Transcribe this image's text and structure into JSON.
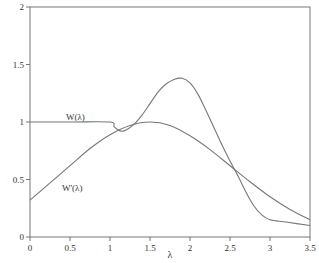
{
  "chart_data": {
    "type": "line",
    "title": "",
    "xlabel": "λ",
    "ylabel": "",
    "xlim": [
      0,
      3.5
    ],
    "ylim": [
      0,
      2
    ],
    "grid": false,
    "legend_position": "inline labels",
    "x_ticks": [
      "0",
      "0.5",
      "1",
      "1.5",
      "2",
      "2.5",
      "3",
      "3.5"
    ],
    "y_ticks": [
      "0",
      "0.5",
      "1",
      "1.5",
      "2"
    ],
    "series": [
      {
        "name": "W(λ)",
        "label_position": {
          "x": 0.45,
          "y": 1.02
        },
        "x": [
          0,
          0.5,
          1.0,
          1.05,
          1.1,
          1.15,
          1.2,
          1.3,
          1.4,
          1.5,
          1.6,
          1.7,
          1.8,
          1.9,
          2.0,
          2.1,
          2.2,
          2.3,
          2.4,
          2.5,
          2.6,
          2.7,
          2.8,
          2.9,
          3.0,
          3.2,
          3.5
        ],
        "values": [
          1.0,
          1.0,
          1.0,
          0.96,
          0.93,
          0.92,
          0.93,
          0.98,
          1.06,
          1.16,
          1.26,
          1.33,
          1.37,
          1.38,
          1.34,
          1.24,
          1.1,
          0.95,
          0.8,
          0.66,
          0.53,
          0.39,
          0.27,
          0.19,
          0.15,
          0.13,
          0.1
        ]
      },
      {
        "name": "W'(λ)",
        "label_position": {
          "x": 0.4,
          "y": 0.4
        },
        "x": [
          0,
          0.25,
          0.5,
          0.75,
          1.0,
          1.25,
          1.5,
          1.75,
          2.0,
          2.25,
          2.5,
          2.75,
          3.0,
          3.25,
          3.5
        ],
        "values": [
          0.32,
          0.47,
          0.62,
          0.77,
          0.89,
          0.97,
          1.0,
          0.97,
          0.88,
          0.76,
          0.62,
          0.48,
          0.35,
          0.24,
          0.15
        ]
      }
    ]
  }
}
